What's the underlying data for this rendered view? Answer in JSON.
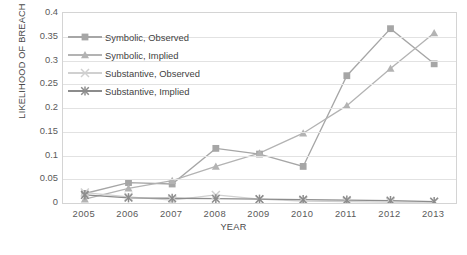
{
  "chart_data": {
    "type": "line",
    "title": "",
    "xlabel": "YEAR",
    "ylabel": "LIKELIHOOD OF BREACH",
    "categories": [
      "2005",
      "2006",
      "2007",
      "2008",
      "2009",
      "2010",
      "2011",
      "2012",
      "2013"
    ],
    "x": [
      2005,
      2006,
      2007,
      2008,
      2009,
      2010,
      2011,
      2012,
      2013
    ],
    "ylim": [
      0,
      0.4
    ],
    "yticks": [
      0,
      0.05,
      0.1,
      0.15,
      0.2,
      0.25,
      0.3,
      0.35,
      0.4
    ],
    "ytick_labels": [
      "0",
      "0.05",
      "0.1",
      "0.15",
      "0.2",
      "0.25",
      "0.3",
      "0.35",
      "0.4"
    ],
    "grid": "horizontal",
    "legend_position": "upper-left-inside",
    "series": [
      {
        "name": "Symbolic, Observed",
        "marker": "square",
        "color": "#a6a6a6",
        "values": [
          0.02,
          0.043,
          0.04,
          0.115,
          0.103,
          0.077,
          0.268,
          0.367,
          0.293
        ]
      },
      {
        "name": "Symbolic, Implied",
        "marker": "triangle",
        "color": "#b3b3b3",
        "values": [
          0.008,
          0.031,
          0.047,
          0.077,
          0.105,
          0.147,
          0.205,
          0.283,
          0.358
        ]
      },
      {
        "name": "Substantive, Observed",
        "marker": "cross",
        "color": "#d0d0d0",
        "values": [
          0.022,
          0.013,
          0.006,
          0.017,
          0.008,
          0.004,
          0.003,
          0.002,
          0.002
        ]
      },
      {
        "name": "Substantive, Implied",
        "marker": "asterisk",
        "color": "#8c8c8c",
        "values": [
          0.017,
          0.011,
          0.01,
          0.009,
          0.008,
          0.007,
          0.006,
          0.005,
          0.003
        ]
      }
    ]
  }
}
